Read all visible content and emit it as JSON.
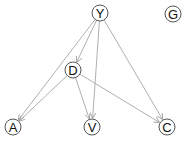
{
  "diagram": {
    "type": "directed-acyclic-graph",
    "node_radius": 8,
    "colors": {
      "edge": "#9a9a9a",
      "node_border": "#555555",
      "node_fill": "#ffffff",
      "label": "#111111"
    },
    "nodes": [
      {
        "id": "Y",
        "label": "Y",
        "x": 100,
        "y": 13
      },
      {
        "id": "G",
        "label": "G",
        "x": 173,
        "y": 14
      },
      {
        "id": "D",
        "label": "D",
        "x": 73,
        "y": 70
      },
      {
        "id": "A",
        "label": "A",
        "x": 13,
        "y": 127
      },
      {
        "id": "V",
        "label": "V",
        "x": 92,
        "y": 127
      },
      {
        "id": "C",
        "label": "C",
        "x": 167,
        "y": 127
      }
    ],
    "edges": [
      {
        "from": "Y",
        "to": "A"
      },
      {
        "from": "Y",
        "to": "D"
      },
      {
        "from": "Y",
        "to": "V"
      },
      {
        "from": "Y",
        "to": "C"
      },
      {
        "from": "D",
        "to": "A"
      },
      {
        "from": "D",
        "to": "V"
      },
      {
        "from": "D",
        "to": "C"
      }
    ]
  }
}
